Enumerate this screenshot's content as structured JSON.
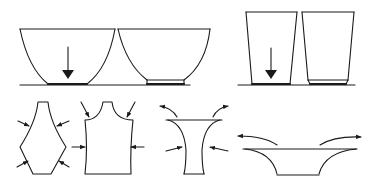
{
  "diagram": {
    "colors": {
      "stroke": "#1a1a1a",
      "background": "#ffffff"
    },
    "top_row": [
      {
        "id": "bowl-no-foot",
        "shape": "round bowl",
        "arrow": "down"
      },
      {
        "id": "bowl-with-foot",
        "shape": "round bowl",
        "foot_ring": true
      },
      {
        "id": "cup-no-foot",
        "shape": "tapered cup",
        "arrow": "down"
      },
      {
        "id": "cup-with-foot",
        "shape": "tapered cup",
        "foot_ring": true
      }
    ],
    "bottom_row": [
      {
        "id": "pattern-diamond",
        "shape": "elongated hexagonal pattern",
        "arrows": "inward x4"
      },
      {
        "id": "pattern-vest",
        "shape": "vest / tank-top pattern",
        "arrows": "inward x4"
      },
      {
        "id": "pattern-flared-neck",
        "shape": "flared trumpet form",
        "arrows": "inward at sides, outward curved at rim"
      },
      {
        "id": "pattern-wide-dish",
        "shape": "wide flared dish",
        "arrows": "outward curved at rim"
      }
    ]
  }
}
